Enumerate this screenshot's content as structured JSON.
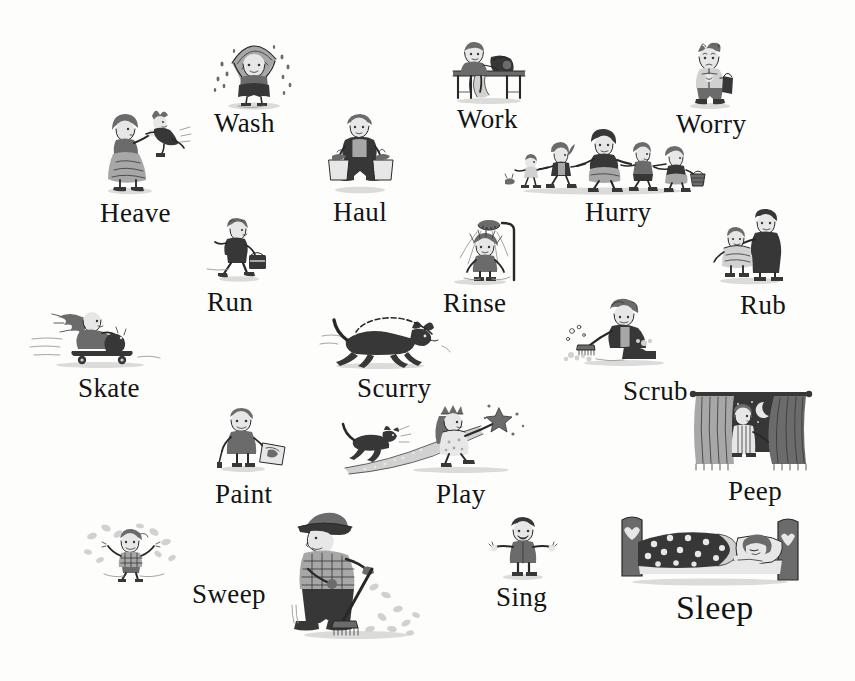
{
  "page": {
    "kind": "picture-book-page",
    "background_color": "#fdfdfc",
    "ink_color": "#131313",
    "width": 855,
    "height": 681
  },
  "words": [
    {
      "id": "wash",
      "label": "Wash",
      "x": 214,
      "y": 110,
      "size": 27,
      "picture": "child-under-towel-dripping-water"
    },
    {
      "id": "work",
      "label": "Work",
      "x": 457,
      "y": 106,
      "size": 27,
      "picture": "child-at-sewing-machine-table"
    },
    {
      "id": "worry",
      "label": "Worry",
      "x": 676,
      "y": 111,
      "size": 27,
      "picture": "child-standing-with-bag-anxious"
    },
    {
      "id": "heave",
      "label": "Heave",
      "x": 100,
      "y": 200,
      "size": 27,
      "picture": "woman-lifting-swinging-child"
    },
    {
      "id": "haul",
      "label": "Haul",
      "x": 333,
      "y": 199,
      "size": 27,
      "picture": "child-carrying-two-shopping-bags"
    },
    {
      "id": "hurry",
      "label": "Hurry",
      "x": 585,
      "y": 199,
      "size": 27,
      "picture": "chain-of-five-children-running-hand-in-hand"
    },
    {
      "id": "run",
      "label": "Run",
      "x": 207,
      "y": 289,
      "size": 27,
      "picture": "child-running-with-lunchbox"
    },
    {
      "id": "rinse",
      "label": "Rinse",
      "x": 443,
      "y": 290,
      "size": 27,
      "picture": "child-under-shower-head"
    },
    {
      "id": "rub",
      "label": "Rub",
      "x": 740,
      "y": 292,
      "size": 27,
      "picture": "adult-drying-child-with-towel"
    },
    {
      "id": "skate",
      "label": "Skate",
      "x": 78,
      "y": 375,
      "size": 27,
      "picture": "girl-riding-skateboard-with-cat"
    },
    {
      "id": "scurry",
      "label": "Scurry",
      "x": 357,
      "y": 375,
      "size": 27,
      "picture": "dog-running-with-trailing-leash"
    },
    {
      "id": "scrub",
      "label": "Scrub",
      "x": 623,
      "y": 378,
      "size": 27,
      "picture": "child-scrubbing-floor-with-brush"
    },
    {
      "id": "paint",
      "label": "Paint",
      "x": 215,
      "y": 481,
      "size": 27,
      "picture": "child-holding-paintbrush-and-painting"
    },
    {
      "id": "play",
      "label": "Play",
      "x": 436,
      "y": 481,
      "size": 27,
      "picture": "girl-in-costume-with-star-wand-and-cat"
    },
    {
      "id": "peep",
      "label": "Peep",
      "x": 728,
      "y": 478,
      "size": 27,
      "picture": "child-peeking-through-curtains-at-night-sky"
    },
    {
      "id": "sweep",
      "label": "Sweep",
      "x": 192,
      "y": 581,
      "size": 27,
      "picture": "man-in-hat-sweeping-leaves-with-broom"
    },
    {
      "id": "sing",
      "label": "Sing",
      "x": 496,
      "y": 584,
      "size": 27,
      "picture": "child-standing-arms-out-singing"
    },
    {
      "id": "sleep",
      "label": "Sleep",
      "x": 676,
      "y": 591,
      "size": 34,
      "picture": "child-asleep-in-bed-with-spotted-quilt"
    }
  ],
  "pictures": [
    {
      "id": "pic-wash",
      "for": "wash",
      "x": 204,
      "y": 33,
      "w": 100,
      "h": 78,
      "name": "child-under-towel-dripping-water"
    },
    {
      "id": "pic-work",
      "for": "work",
      "x": 441,
      "y": 35,
      "w": 96,
      "h": 70,
      "name": "child-at-sewing-machine-table"
    },
    {
      "id": "pic-worry",
      "for": "worry",
      "x": 676,
      "y": 38,
      "w": 70,
      "h": 72,
      "name": "child-standing-with-bag-anxious"
    },
    {
      "id": "pic-heave",
      "for": "heave",
      "x": 94,
      "y": 106,
      "w": 100,
      "h": 90,
      "name": "woman-lifting-swinging-child"
    },
    {
      "id": "pic-haul",
      "for": "haul",
      "x": 319,
      "y": 112,
      "w": 82,
      "h": 82,
      "name": "child-carrying-two-shopping-bags"
    },
    {
      "id": "pic-hurry",
      "for": "hurry",
      "x": 503,
      "y": 128,
      "w": 203,
      "h": 68,
      "name": "chain-of-five-children-running-hand-in-hand"
    },
    {
      "id": "pic-run",
      "for": "run",
      "x": 205,
      "y": 217,
      "w": 68,
      "h": 66,
      "name": "child-running-with-lunchbox"
    },
    {
      "id": "pic-rinse",
      "for": "rinse",
      "x": 440,
      "y": 218,
      "w": 92,
      "h": 68,
      "name": "child-under-shower-head"
    },
    {
      "id": "pic-rub",
      "for": "rub",
      "x": 705,
      "y": 208,
      "w": 90,
      "h": 78,
      "name": "adult-drying-child-with-towel"
    },
    {
      "id": "pic-skate",
      "for": "skate",
      "x": 30,
      "y": 305,
      "w": 130,
      "h": 66,
      "name": "girl-riding-skateboard-with-cat"
    },
    {
      "id": "pic-scurry",
      "for": "scurry",
      "x": 320,
      "y": 312,
      "w": 130,
      "h": 58,
      "name": "dog-running-with-trailing-leash"
    },
    {
      "id": "pic-scrub",
      "for": "scrub",
      "x": 562,
      "y": 297,
      "w": 116,
      "h": 72,
      "name": "child-scrubbing-floor-with-brush"
    },
    {
      "id": "pic-paint",
      "for": "paint",
      "x": 205,
      "y": 407,
      "w": 86,
      "h": 68,
      "name": "child-holding-paintbrush-and-painting"
    },
    {
      "id": "pic-play",
      "for": "play",
      "x": 341,
      "y": 400,
      "w": 200,
      "h": 76,
      "name": "girl-in-costume-with-star-wand-and-cat"
    },
    {
      "id": "pic-peep",
      "for": "peep",
      "x": 690,
      "y": 384,
      "w": 122,
      "h": 88,
      "name": "child-peeking-through-curtains-at-night-sky"
    },
    {
      "id": "pic-sweep",
      "for": "sweep",
      "x": 80,
      "y": 520,
      "w": 110,
      "h": 62,
      "name": "child-jumping-in-leaves"
    },
    {
      "id": "pic-rake",
      "for": "sweep",
      "x": 286,
      "y": 505,
      "w": 150,
      "h": 136,
      "name": "man-in-hat-sweeping-leaves-with-broom"
    },
    {
      "id": "pic-sing",
      "for": "sing",
      "x": 489,
      "y": 515,
      "w": 68,
      "h": 66,
      "name": "child-standing-arms-out-singing"
    },
    {
      "id": "pic-sleep",
      "for": "sleep",
      "x": 614,
      "y": 508,
      "w": 192,
      "h": 78,
      "name": "child-asleep-in-bed-with-spotted-quilt"
    }
  ]
}
